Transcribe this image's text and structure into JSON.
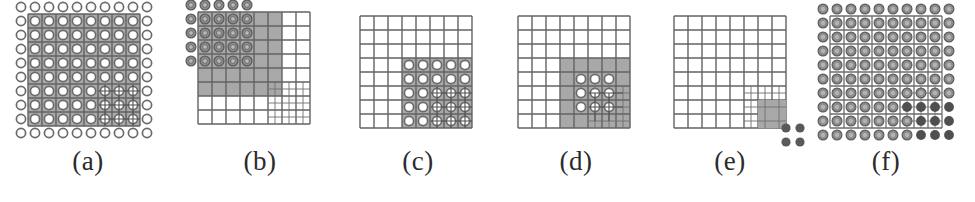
{
  "figure": {
    "type": "diagram",
    "background_color": "#ffffff",
    "colors": {
      "grid_line": "#6e6e6e",
      "grid_line_fine": "#7d7d7d",
      "shade_fill": "#a8a8a8",
      "node_ring_stroke": "#6a6a6a",
      "node_ring_fill": "#ffffff",
      "node_filled_light": "#8c8c8c",
      "node_filled_dark": "#5a5a5a",
      "label_color": "#2b2b2b"
    },
    "panel_count": 6
  },
  "panels": [
    {
      "id": "a",
      "label": "(a)",
      "grid": {
        "cols": 8,
        "rows": 8
      },
      "shaded": {
        "x": 0,
        "y": 0,
        "w": 8,
        "h": 8
      },
      "refined": {
        "x": 5,
        "y": 5,
        "w": 3,
        "h": 3,
        "factor": 2
      },
      "nodes": {
        "style": "ring",
        "cols": 10,
        "rows": 10
      },
      "fine_nodes": {
        "style": "ring-cross",
        "region": "refined"
      }
    },
    {
      "id": "b",
      "label": "(b)",
      "grid": {
        "cols": 8,
        "rows": 8
      },
      "shaded": {
        "x": 0,
        "y": 0,
        "w": 5,
        "h": 5
      },
      "refined": {
        "x": 5,
        "y": 5,
        "w": 3,
        "h": 3,
        "factor": 2
      },
      "nodes": {
        "style": "ring-filled",
        "cols": 5,
        "rows": 5
      }
    },
    {
      "id": "c",
      "label": "(c)",
      "grid": {
        "cols": 8,
        "rows": 8
      },
      "shaded": {
        "x": 3,
        "y": 3,
        "w": 5,
        "h": 5
      },
      "refined": {
        "x": 5,
        "y": 5,
        "w": 3,
        "h": 3,
        "factor": 2
      },
      "nodes": {
        "style": "ring",
        "cols": 5,
        "rows": 5
      },
      "fine_nodes": {
        "style": "ring-cross",
        "region": "refined"
      }
    },
    {
      "id": "d",
      "label": "(d)",
      "grid": {
        "cols": 8,
        "rows": 8
      },
      "shaded": {
        "x": 3,
        "y": 3,
        "w": 5,
        "h": 5
      },
      "refined": {
        "x": 5,
        "y": 5,
        "w": 3,
        "h": 3,
        "factor": 2
      },
      "nodes": {
        "style": "ring",
        "cols": 3,
        "rows": 3
      },
      "fine_nodes": {
        "style": "ring-cross",
        "region": "refined"
      }
    },
    {
      "id": "e",
      "label": "(e)",
      "grid": {
        "cols": 8,
        "rows": 8
      },
      "shaded": {
        "x": 6,
        "y": 6,
        "w": 2,
        "h": 2
      },
      "refined": {
        "x": 5,
        "y": 5,
        "w": 3,
        "h": 3,
        "factor": 2
      },
      "nodes": {
        "style": "dot-dark",
        "cols": 2,
        "rows": 2
      }
    },
    {
      "id": "f",
      "label": "(f)",
      "grid": {
        "cols": 8,
        "rows": 8
      },
      "shaded": null,
      "refined": {
        "x": 5,
        "y": 5,
        "w": 3,
        "h": 3,
        "factor": 2
      },
      "nodes": {
        "style": "ring-filled",
        "cols": 10,
        "rows": 10
      },
      "fine_nodes": {
        "style": "dot-dark",
        "region": "refined"
      }
    }
  ],
  "labels": {
    "a": "(a)",
    "b": "(b)",
    "c": "(c)",
    "d": "(d)",
    "e": "(e)",
    "f": "(f)"
  }
}
